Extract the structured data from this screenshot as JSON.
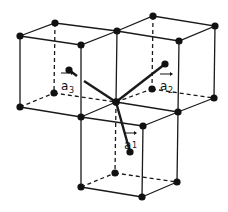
{
  "diagram": {
    "title": "",
    "colors": {
      "line": "#1a1a1a",
      "background": "#ffffff"
    },
    "labels": {
      "a1": {
        "base": "a",
        "sub": "1"
      },
      "a2": {
        "base": "a",
        "sub": "2"
      },
      "a3": {
        "base": "a",
        "sub": "3"
      }
    }
  }
}
